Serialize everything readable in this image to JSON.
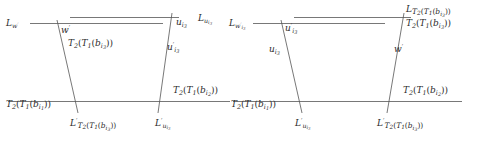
{
  "figure": {
    "stroke_color": "#555555",
    "text_color": "#2b2b2b",
    "background": "#ffffff"
  },
  "left_diagram": {
    "name": "left-trapezoid",
    "labels": {
      "top_left": "L_{w'}",
      "top_left_inner": "w'",
      "left_slant": "T_2(T_1(b_{i_3}))",
      "top_right_inner": "u_{i_3}",
      "top_right": "L_{u_{i_3}}",
      "right_slant": "u'_{i_3}",
      "right_mid": "T_2(T_1(b_{i_2}))",
      "bottom_left": "T_2(T_1(b_{i_1}))",
      "bottom_inner_left": "L'_{T_2(T_1(b_{i_3}))}",
      "bottom_inner_right": "L'_{u_{i_3}}"
    }
  },
  "right_diagram": {
    "name": "right-trapezoid",
    "labels": {
      "top_left": "L_{w'_{i_3}}",
      "top_left_inner": "u'_{i_3}",
      "left_slant": "u_{i_3}",
      "top_right_upper": "L_{T_2(T_1(b_{i_3}))}",
      "top_right_lower": "T_2(T_1(b_{i_3}))",
      "right_slant": "w'",
      "right_mid": "T_2(T_1(b_{i_2}))",
      "bottom_left": "T_2(T_1(b_{i_1}))",
      "bottom_inner_left": "L'_{u_{i_3}}",
      "bottom_inner_right": "L'_{T_2(T_1(b_{i_3}))}"
    }
  }
}
